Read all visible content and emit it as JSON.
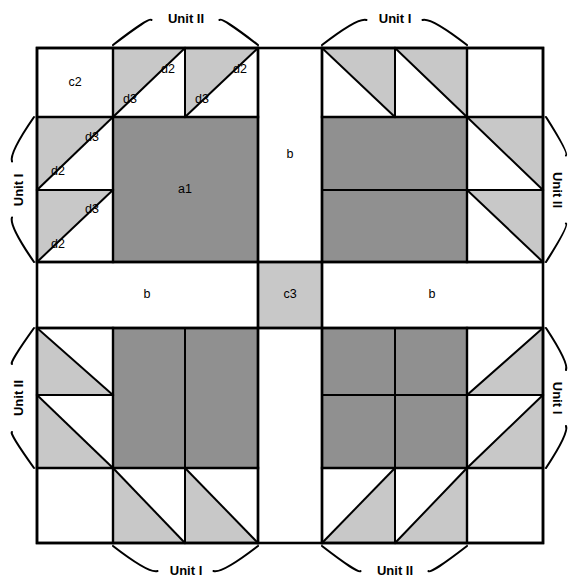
{
  "diagram": {
    "canvas": {
      "width": 576,
      "height": 588
    },
    "colors": {
      "dark_fabric": "#909090",
      "light_fabric": "#c8c8c8",
      "background_fabric": "#ffffff",
      "line": "#000000"
    },
    "grid": {
      "left": 37,
      "right": 543,
      "top": 48,
      "bottom": 543,
      "columns": [
        37,
        113,
        185,
        258,
        322,
        395,
        467,
        543
      ],
      "rows": [
        48,
        117,
        190,
        262,
        328,
        395,
        468,
        543
      ]
    },
    "patch_labels": {
      "a1": "a1",
      "b": "b",
      "c2": "c2",
      "c3": "c3",
      "d2": "d2",
      "d3": "d3"
    },
    "unit_brackets": [
      {
        "id": "bracket-top-left",
        "label": "Unit II",
        "side": "top",
        "from": 113,
        "to": 258,
        "text_x": 186,
        "text_y": 14
      },
      {
        "id": "bracket-top-right",
        "label": "Unit I",
        "side": "top",
        "from": 322,
        "to": 467,
        "text_x": 395,
        "text_y": 14
      },
      {
        "id": "bracket-left-upper",
        "label": "Unit I",
        "side": "left",
        "from": 117,
        "to": 262,
        "text_x": 16,
        "text_y": 190
      },
      {
        "id": "bracket-left-lower",
        "label": "Unit II",
        "side": "left",
        "from": 328,
        "to": 468,
        "text_x": 16,
        "text_y": 398
      },
      {
        "id": "bracket-right-upper",
        "label": "Unit II",
        "side": "right",
        "from": 117,
        "to": 262,
        "text_x": 560,
        "text_y": 190
      },
      {
        "id": "bracket-right-lower",
        "label": "Unit I",
        "side": "right",
        "from": 328,
        "to": 468,
        "text_x": 560,
        "text_y": 398
      },
      {
        "id": "bracket-bottom-left",
        "label": "Unit I",
        "side": "bottom",
        "from": 113,
        "to": 258,
        "text_x": 186,
        "text_y": 573
      },
      {
        "id": "bracket-bottom-right",
        "label": "Unit II",
        "side": "bottom",
        "from": 322,
        "to": 467,
        "text_x": 395,
        "text_y": 573
      }
    ],
    "quadrants": [
      {
        "id": "quadrant-top-left",
        "labels": [
          {
            "name": "label-c2-top-left",
            "key": "c2",
            "x": 75,
            "y": 83
          },
          {
            "name": "label-d2-top-1",
            "key": "d2",
            "x": 168,
            "y": 70
          },
          {
            "name": "label-d3-top-1",
            "key": "d3",
            "x": 130,
            "y": 100
          },
          {
            "name": "label-d2-top-2",
            "key": "d2",
            "x": 240,
            "y": 70
          },
          {
            "name": "label-d3-top-2",
            "key": "d3",
            "x": 202,
            "y": 100
          },
          {
            "name": "label-d3-left-1",
            "key": "d3",
            "x": 92,
            "y": 138
          },
          {
            "name": "label-d2-left-1",
            "key": "d2",
            "x": 58,
            "y": 172
          },
          {
            "name": "label-d3-left-2",
            "key": "d3",
            "x": 92,
            "y": 210
          },
          {
            "name": "label-d2-left-2",
            "key": "d2",
            "x": 58,
            "y": 245
          },
          {
            "name": "label-a1-top-left",
            "key": "a1",
            "x": 185,
            "y": 190
          }
        ]
      },
      {
        "id": "quadrant-top-right",
        "labels": []
      },
      {
        "id": "quadrant-bottom-left",
        "labels": []
      },
      {
        "id": "quadrant-bottom-right",
        "labels": []
      }
    ],
    "strip_labels": [
      {
        "name": "label-b-top",
        "key": "b",
        "x": 290,
        "y": 155
      },
      {
        "name": "label-b-left",
        "key": "b",
        "x": 147,
        "y": 295
      },
      {
        "name": "label-b-right",
        "key": "b",
        "x": 432,
        "y": 295
      },
      {
        "name": "label-c3-center",
        "key": "c3",
        "x": 290,
        "y": 295
      }
    ]
  }
}
